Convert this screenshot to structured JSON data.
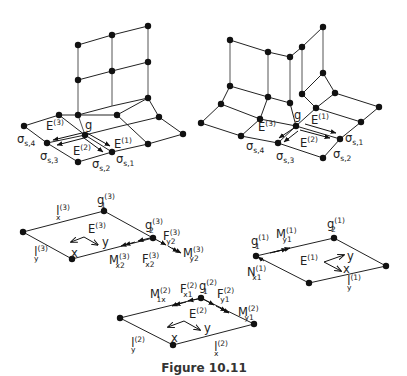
{
  "caption": "Figure 10.11",
  "panels": {
    "top_left": {
      "node_label": "g",
      "elements": [
        "E",
        "E",
        "E"
      ],
      "element_sups": [
        "(1)",
        "(2)",
        "(3)"
      ],
      "sigma": "σ",
      "sigma_subs": [
        "s,1",
        "s,2",
        "s,3",
        "s,4"
      ]
    },
    "top_right": {
      "node_label": "g",
      "elements": [
        "E",
        "E",
        "E"
      ],
      "element_sups": [
        "(1)",
        "(2)",
        "(3)"
      ],
      "sigma": "σ",
      "sigma_subs": [
        "s,1",
        "s,2",
        "s,3",
        "s,4"
      ]
    },
    "element3": {
      "E": "E",
      "E_sup": "(3)",
      "lx": "l",
      "lx_sup": "(3)",
      "lx_sub": "x",
      "ly": "l",
      "ly_sup": "(3)",
      "ly_sub": "y",
      "g1": "g",
      "g1_sup": "(3)",
      "g1_sub": "1",
      "g2": "g",
      "g2_sup": "(3)",
      "g2_sub": "2",
      "Fy2": "F",
      "Fy2_sup": "(3)",
      "Fy2_sub": "y2",
      "My2": "M",
      "My2_sup": "(3)",
      "My2_sub": "y2",
      "Mx2": "M",
      "Mx2_sup": "(3)",
      "Mx2_sub": "x2",
      "Fx2": "F",
      "Fx2_sup": "(3)",
      "Fx2_sub": "x2",
      "axis_x": "x",
      "axis_y": "y"
    },
    "element1": {
      "E": "E",
      "E_sup": "(1)",
      "g1": "g",
      "g1_sup": "(1)",
      "g1_sub": "1",
      "g2": "g",
      "g2_sup": "(1)",
      "g2_sub": "2",
      "My1": "M",
      "My1_sup": "(1)",
      "My1_sub": "y1",
      "Nx1": "N",
      "Nx1_sup": "(1)",
      "Nx1_sub": "x1",
      "ly": "l",
      "ly_sup": "(1)",
      "ly_sub": "y",
      "axis_x": "x",
      "axis_y": "y"
    },
    "element2": {
      "E": "E",
      "E_sup": "(2)",
      "M1x": "M",
      "M1x_sup": "(2)",
      "M1x_sub": "1x",
      "Fx1": "F",
      "Fx1_sup": "(2)",
      "Fx1_sub": "x1",
      "g1": "g",
      "g1_sup": "(2)",
      "g1_sub": "1",
      "Fy1": "F",
      "Fy1_sup": "(2)",
      "Fy1_sub": "y1",
      "My1": "M",
      "My1_sup": "(2)",
      "My1_sub": "y1",
      "ly": "l",
      "ly_sup": "(2)",
      "ly_sub": "y",
      "lx": "l",
      "lx_sup": "(2)",
      "lx_sub": "x",
      "axis_x": "x",
      "axis_y": "y"
    }
  }
}
